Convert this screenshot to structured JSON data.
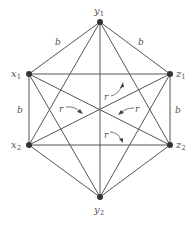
{
  "diagram": {
    "type": "graph",
    "vertices": [
      {
        "id": "y1",
        "label": "y",
        "sub": "1",
        "x": 100,
        "y": 22
      },
      {
        "id": "x1",
        "label": "x",
        "sub": "1",
        "x": 29,
        "y": 74
      },
      {
        "id": "z1",
        "label": "z",
        "sub": "1",
        "x": 170,
        "y": 74
      },
      {
        "id": "x2",
        "label": "x",
        "sub": "2",
        "x": 29,
        "y": 145
      },
      {
        "id": "z2",
        "label": "z",
        "sub": "2",
        "x": 170,
        "y": 145
      },
      {
        "id": "y2",
        "label": "y",
        "sub": "2",
        "x": 100,
        "y": 197
      }
    ],
    "edge_labels": {
      "y1_x1": "b",
      "y1_z1": "b",
      "x1_x2": "b",
      "z1_z2": "b"
    },
    "region_labels": [
      "r",
      "r",
      "r",
      "r"
    ]
  }
}
